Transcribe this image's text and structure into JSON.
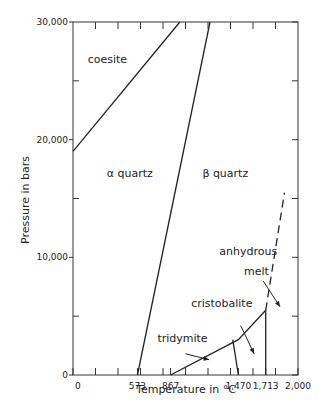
{
  "chart_data": {
    "type": "line",
    "title": "",
    "xlabel": "Temperature in °C",
    "ylabel": "Pressure in bars",
    "xlim": [
      0,
      2000
    ],
    "ylim": [
      0,
      30000
    ],
    "x_tick_labels": [
      {
        "value": 0,
        "label": "0"
      },
      {
        "value": 573,
        "label": "573"
      },
      {
        "value": 867,
        "label": "867"
      },
      {
        "value": 1470,
        "label": "1,470"
      },
      {
        "value": 1713,
        "label": "1,713"
      },
      {
        "value": 2000,
        "label": "2,000"
      }
    ],
    "x_minor_ticks": [
      200,
      400,
      600,
      800,
      1000,
      1200,
      1400,
      1600,
      1800
    ],
    "y_tick_labels": [
      {
        "value": 0,
        "label": "0"
      },
      {
        "value": 10000,
        "label": "10,000"
      },
      {
        "value": 20000,
        "label": "20,000"
      },
      {
        "value": 30000,
        "label": "30,000"
      }
    ],
    "y_minor_ticks": [
      5000,
      15000,
      25000
    ],
    "grid": false,
    "series": [
      {
        "name": "coesite-alpha-quartz boundary",
        "style": "solid",
        "points": [
          [
            0,
            19000
          ],
          [
            950,
            30000
          ]
        ]
      },
      {
        "name": "alpha-beta quartz boundary",
        "style": "solid",
        "points": [
          [
            573,
            0
          ],
          [
            1218,
            30000
          ]
        ]
      },
      {
        "name": "tridymite-cristobalite lower boundary",
        "style": "solid",
        "points": [
          [
            867,
            0
          ],
          [
            1470,
            3000
          ],
          [
            1713,
            5500
          ]
        ]
      },
      {
        "name": "tridymite-cristobalite boundary",
        "style": "solid",
        "points": [
          [
            1470,
            0
          ],
          [
            1420,
            3000
          ]
        ]
      },
      {
        "name": "cristobalite-melt boundary",
        "style": "solid",
        "points": [
          [
            1713,
            0
          ],
          [
            1713,
            5500
          ]
        ]
      },
      {
        "name": "quartz-melt boundary",
        "style": "dashed",
        "points": [
          [
            1713,
            5500
          ],
          [
            1880,
            15500
          ]
        ]
      }
    ],
    "annotations": [
      {
        "text": "coesite",
        "x": 130,
        "y": 26500
      },
      {
        "text": "α quartz",
        "x": 300,
        "y": 16800
      },
      {
        "text": "β quartz",
        "x": 1150,
        "y": 16800
      },
      {
        "text": "anhydrous",
        "x": 1300,
        "y": 10200
      },
      {
        "text": "melt",
        "x": 1520,
        "y": 8500
      },
      {
        "text": "cristobalite",
        "x": 1050,
        "y": 5800
      },
      {
        "text": "tridymite",
        "x": 750,
        "y": 2800
      }
    ],
    "arrows": [
      {
        "from": [
          1690,
          8000
        ],
        "to": [
          1840,
          5800
        ]
      },
      {
        "from": [
          1490,
          4200
        ],
        "to": [
          1610,
          1800
        ]
      },
      {
        "from": [
          1000,
          1800
        ],
        "to": [
          1210,
          1300
        ]
      }
    ]
  }
}
